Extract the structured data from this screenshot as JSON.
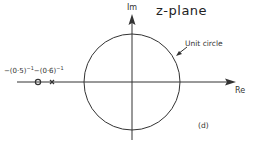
{
  "diagram": {
    "title": "z-plane",
    "axes": {
      "imaginary_label": "Im",
      "real_label": "Re"
    },
    "unit_circle_label": "Unit circle",
    "panel_label": "(d)",
    "points_label": {
      "zero": "−(0·5)",
      "zero_exp": "−1",
      "pole": "−(0·6)",
      "pole_exp": "−1"
    },
    "markers": [
      {
        "type": "zero",
        "symbol": "o",
        "value": "-(0.5)^-1"
      },
      {
        "type": "pole",
        "symbol": "x",
        "value": "-(0.6)^-1"
      }
    ],
    "colors": {
      "stroke": "#333333",
      "background": "#ffffff"
    }
  }
}
